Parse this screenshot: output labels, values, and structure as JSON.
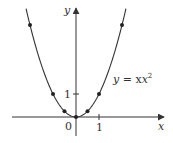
{
  "chart_data": {
    "type": "line",
    "title": "",
    "xlabel": "x",
    "ylabel": "y",
    "curve_label": "y = x²",
    "equation": "y = x^2",
    "x": [
      -2,
      -1,
      -0.5,
      0,
      0.5,
      1,
      2
    ],
    "y": [
      4,
      1,
      0.25,
      0,
      0.25,
      1,
      4
    ],
    "marked_points": [
      [
        -2,
        4
      ],
      [
        -1,
        1
      ],
      [
        -0.5,
        0.25
      ],
      [
        0,
        0
      ],
      [
        0.5,
        0.25
      ],
      [
        1,
        1
      ],
      [
        2,
        4
      ]
    ],
    "xticks": [
      {
        "value": 1,
        "label": "1"
      }
    ],
    "yticks": [
      {
        "value": 1,
        "label": "1"
      }
    ],
    "origin_label": "0",
    "xlim": [
      -2.8,
      3.6
    ],
    "ylim": [
      -0.9,
      4.7
    ],
    "grid": false,
    "legend": null
  },
  "labels": {
    "x_axis": "x",
    "y_axis": "y",
    "origin": "0",
    "x_tick_1": "1",
    "y_tick_1": "1",
    "curve_y": "y",
    "curve_eq": " = x",
    "curve_exp": "2"
  },
  "colors": {
    "curve": "#333333",
    "axis": "#333333",
    "points": "#222222"
  }
}
